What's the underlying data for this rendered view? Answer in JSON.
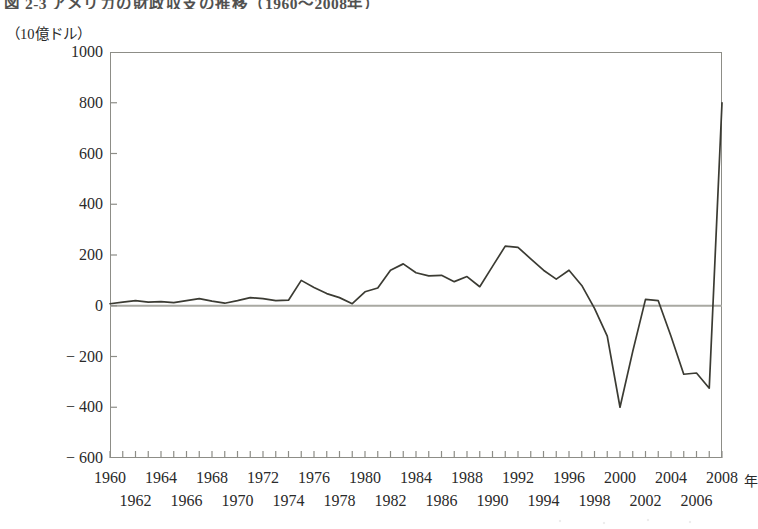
{
  "chart_title": "図 2-3  アメリカの財政収支の推移（1960〜2008年）",
  "y_axis_unit": "（10億ドル）",
  "x_axis_unit": "年",
  "line_color": "#3b3b33",
  "axis_color": "#8d8d87",
  "zero_line_color": "#a9a9a2",
  "chart_data": {
    "type": "line",
    "title": "図 2-3  アメリカの財政収支の推移（1960〜2008年）",
    "xlabel": "年",
    "ylabel": "（10億ドル）",
    "ylim": [
      -600,
      1000
    ],
    "xlim": [
      1960,
      2008
    ],
    "yticks": [
      1000,
      800,
      600,
      400,
      200,
      0,
      -200,
      -400,
      -600
    ],
    "ytick_labels": [
      "1000",
      "800",
      "600",
      "400",
      "200",
      "0",
      "− 200",
      "− 400",
      "− 600"
    ],
    "xticks_top": [
      1960,
      1964,
      1968,
      1972,
      1976,
      1980,
      1984,
      1988,
      1992,
      1996,
      2000,
      2004,
      2008
    ],
    "xticks_bottom": [
      1962,
      1966,
      1970,
      1974,
      1978,
      1982,
      1986,
      1990,
      1994,
      1998,
      2002,
      2006
    ],
    "grid": false,
    "legend": false,
    "zero_reference_line": 0,
    "x": [
      1960,
      1961,
      1962,
      1963,
      1964,
      1965,
      1966,
      1967,
      1968,
      1969,
      1970,
      1971,
      1972,
      1973,
      1974,
      1975,
      1976,
      1977,
      1978,
      1979,
      1980,
      1981,
      1982,
      1983,
      1984,
      1985,
      1986,
      1987,
      1988,
      1989,
      1990,
      1991,
      1992,
      1993,
      1994,
      1995,
      1996,
      1997,
      1998,
      1999,
      2000,
      2001,
      2002,
      2003,
      2004,
      2005,
      2006,
      2007,
      2008
    ],
    "values": [
      8,
      14,
      20,
      14,
      16,
      12,
      20,
      28,
      18,
      10,
      20,
      32,
      28,
      20,
      22,
      100,
      72,
      48,
      32,
      8,
      55,
      70,
      140,
      165,
      130,
      118,
      120,
      95,
      115,
      75,
      155,
      235,
      230,
      185,
      140,
      105,
      140,
      80,
      -10,
      -120,
      -400,
      -180,
      25,
      20,
      -120,
      -270,
      -265,
      -325,
      800
    ],
    "series_note": "United States federal budget deficit / surplus, billions of USD, 1960-2008"
  },
  "axis_geometry": {
    "plot_left": 110,
    "plot_top": 52,
    "plot_width": 612,
    "plot_height": 406
  }
}
